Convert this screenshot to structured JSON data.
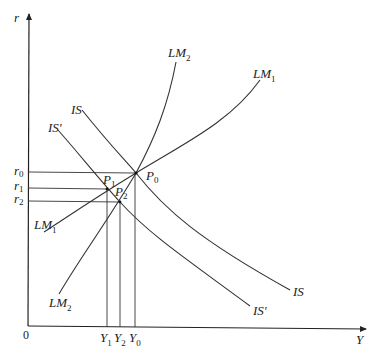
{
  "diagram": {
    "axes": {
      "y_label": "r",
      "x_label": "Y",
      "origin_label": "0"
    },
    "curves": [
      {
        "id": "IS",
        "label": "IS",
        "label_end": "IS"
      },
      {
        "id": "IS_prime",
        "label": "IS'",
        "label_end": "IS'"
      },
      {
        "id": "LM1",
        "label": "LM",
        "sub": "1"
      },
      {
        "id": "LM2",
        "label": "LM",
        "sub": "2"
      }
    ],
    "points": [
      {
        "id": "P0",
        "label": "P",
        "sub": "0"
      },
      {
        "id": "P1",
        "label": "P",
        "sub": "1"
      },
      {
        "id": "P2",
        "label": "P",
        "sub": "2"
      }
    ],
    "r_ticks": [
      {
        "label": "r",
        "sub": "0"
      },
      {
        "label": "r",
        "sub": "1"
      },
      {
        "label": "r",
        "sub": "2"
      }
    ],
    "y_ticks": [
      {
        "label": "Y",
        "sub": "1"
      },
      {
        "label": "Y",
        "sub": "2"
      },
      {
        "label": "Y",
        "sub": "0"
      }
    ]
  }
}
